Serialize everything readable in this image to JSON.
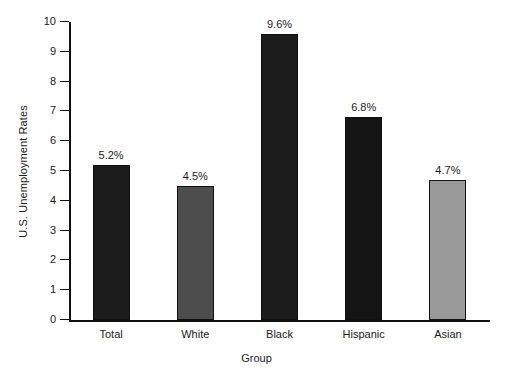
{
  "chart_data": {
    "type": "bar",
    "title": "",
    "subtitle": "",
    "xlabel": "Group",
    "ylabel": "U.S. Unemployment Rates",
    "categories": [
      "Total",
      "White",
      "Black",
      "Hispanic",
      "Asian"
    ],
    "values": [
      5.2,
      4.5,
      9.6,
      6.8,
      4.7
    ],
    "value_labels": [
      "5.2%",
      "4.5%",
      "9.6%",
      "6.8%",
      "4.7%"
    ],
    "bar_colors": [
      "#1c1c1c",
      "#4d4d4d",
      "#1c1c1c",
      "#141414",
      "#9a9a9a"
    ],
    "bar_edge_color": "#111111",
    "ylim": [
      0,
      10
    ],
    "yticks": [
      0,
      1,
      2,
      3,
      4,
      5,
      6,
      7,
      8,
      9,
      10
    ],
    "ytick_labels": [
      "0",
      "1",
      "2",
      "3",
      "4",
      "5",
      "6",
      "7",
      "8",
      "9",
      "10"
    ],
    "grid": false,
    "legend": false,
    "legend_position": "none",
    "axis_color": "#111111",
    "background_color": "#ffffff"
  },
  "axes": {
    "x_title": "Group",
    "y_title": "U.S. Unemployment Rates"
  }
}
